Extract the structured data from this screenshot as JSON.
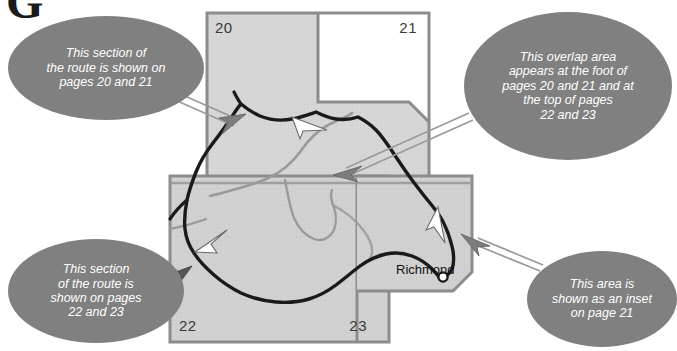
{
  "figure": {
    "type": "map-key-diagram",
    "corner_glyph": "G"
  },
  "colors": {
    "callout_fill": "#808080",
    "callout_text": "#ffffff",
    "page_box_fill": "#d6d6d6",
    "page_box_border": "#8c8c8c",
    "page_number_text": "#3a3a3a",
    "route_line": "#1a1a1a",
    "secondary_road": "#9a9a9a",
    "leader_arrow": "#7d7d7d",
    "white_arrow_fill": "#ffffff",
    "background": "#ffffff"
  },
  "map": {
    "page_boxes": [
      {
        "label": "20",
        "x": 207,
        "y": 13,
        "w": 222,
        "h": 170,
        "shaded": true,
        "num_x": 8,
        "num_y": 6,
        "align": "left"
      },
      {
        "label": "21",
        "x": 207,
        "y": 13,
        "w": 222,
        "h": 170,
        "shaded": false,
        "num_x": 196,
        "num_y": 6,
        "align": "right"
      },
      {
        "label": "22",
        "x": 170,
        "y": 176,
        "w": 219,
        "h": 166,
        "shaded": true,
        "num_x": 8,
        "num_y": 140,
        "align": "left"
      },
      {
        "label": "23",
        "x": 170,
        "y": 176,
        "w": 219,
        "h": 166,
        "shaded": true,
        "num_x": 192,
        "num_y": 140,
        "align": "right"
      }
    ],
    "inset_box": {
      "label": "inset on page 21",
      "x": 357,
      "y": 176,
      "w": 115,
      "h": 114
    },
    "place_labels": [
      {
        "name": "Richmond",
        "text": "Richmond"
      }
    ]
  },
  "callouts": [
    {
      "id": "callout-0",
      "name": "callout-pages-20-21",
      "text": "This section of\nthe route is shown on\npages 20 and 21",
      "points_to": "upper-left of page 20 box"
    },
    {
      "id": "callout-1",
      "name": "callout-overlap-area",
      "text": "This overlap area\nappears at the foot of\npages 20 and 21 and at\nthe top of pages\n22 and 23",
      "points_to": "overlap band between upper and lower boxes"
    },
    {
      "id": "callout-2",
      "name": "callout-pages-22-23",
      "text": "This section\nof the route is\nshown on pages\n22 and 23",
      "points_to": "left edge of page 22 box"
    },
    {
      "id": "callout-3",
      "name": "callout-inset-page-21",
      "text": "This area is\nshown as an inset\non page 21",
      "points_to": "inset box near Richmond"
    }
  ]
}
